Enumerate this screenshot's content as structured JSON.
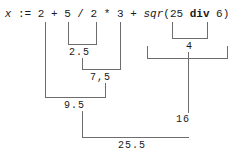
{
  "diagram": {
    "title_expression": "x := 2 + 5 / 2 * 3 + sqr(25 div 6)",
    "expression_tokens": {
      "variable": "x",
      "assign": ":=",
      "operand_2": "2",
      "plus_1": "+",
      "operand_5": "5",
      "divide": "/",
      "operand_2b": "2",
      "times": "*",
      "operand_3": "3",
      "plus_2": "+",
      "func": "sqr",
      "paren_open": "(",
      "operand_25": "25",
      "div_kw": "div",
      "operand_6": "6",
      "paren_close": ")"
    },
    "steps": [
      {
        "id": "step-2-5",
        "label": "2.5",
        "from": "5 / 2",
        "note": "division evaluated first"
      },
      {
        "id": "step-4",
        "label": "4",
        "from": "25 div 6",
        "note": "integer division"
      },
      {
        "id": "step-7-5",
        "label": "7,5",
        "from": "2.5 * 3",
        "note": "multiplication"
      },
      {
        "id": "step-9-5",
        "label": "9.5",
        "from": "2 + 7.5",
        "note": "addition"
      },
      {
        "id": "step-16",
        "label": "16",
        "from": "sqr(4)",
        "note": "square of 4"
      },
      {
        "id": "step-25-5",
        "label": "25.5",
        "from": "9.5 + 16",
        "note": "final result"
      }
    ],
    "result": "25.5"
  },
  "colors": {
    "line": "#6d6d6d",
    "text": "#1a1a1a",
    "background": "#ffffff"
  }
}
